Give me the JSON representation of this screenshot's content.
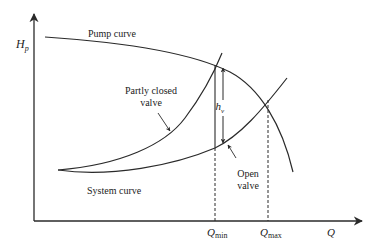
{
  "diagram": {
    "title": "",
    "axes": {
      "y_label": "H",
      "y_label_sub": "p",
      "x_label": "Q"
    },
    "labels": {
      "pump_curve": "Pump curve",
      "partly_closed_line1": "Partly closed",
      "partly_closed_line2": "valve",
      "system_curve": "System curve",
      "open_valve_line1": "Open",
      "open_valve_line2": "valve",
      "hv": "h",
      "hv_sub": "v",
      "q_min": "Q",
      "q_min_sub": "min",
      "q_max": "Q",
      "q_max_sub": "max"
    },
    "colors": {
      "line": "#2a2a2a",
      "background": "#ffffff"
    }
  }
}
